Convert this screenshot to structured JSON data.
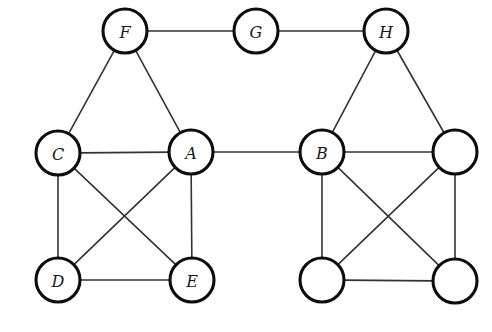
{
  "figure": {
    "width": 492,
    "height": 332,
    "background": "#ffffff",
    "caption": "",
    "node_radius": 22,
    "node_stroke": "#0d0d0d",
    "node_fill": "#ffffff",
    "edge_color": "#333333"
  },
  "graph_data": {
    "type": "node-link-diagram",
    "directed": false,
    "description": "Two complete K4 clusters joined by a single bridge edge A-B, each cluster capped by an apex node (F on the left, H on the right), with F and H linked through an intermediate node G.",
    "node_count": 11,
    "edge_count": 19,
    "nodes": [
      {
        "id": "F",
        "label": "F",
        "x": 125,
        "y": 31,
        "labeled": true
      },
      {
        "id": "G",
        "label": "G",
        "x": 256,
        "y": 31,
        "labeled": true
      },
      {
        "id": "H",
        "label": "H",
        "x": 386,
        "y": 31,
        "labeled": true
      },
      {
        "id": "C",
        "label": "C",
        "x": 58,
        "y": 153,
        "labeled": true
      },
      {
        "id": "A",
        "label": "A",
        "x": 191,
        "y": 152,
        "labeled": true
      },
      {
        "id": "B",
        "label": "B",
        "x": 322,
        "y": 152,
        "labeled": true
      },
      {
        "id": "R1",
        "label": "",
        "x": 455,
        "y": 152,
        "labeled": false
      },
      {
        "id": "D",
        "label": "D",
        "x": 58,
        "y": 280,
        "labeled": true
      },
      {
        "id": "E",
        "label": "E",
        "x": 192,
        "y": 280,
        "labeled": true
      },
      {
        "id": "R2",
        "label": "",
        "x": 322,
        "y": 280,
        "labeled": false
      },
      {
        "id": "R3",
        "label": "",
        "x": 455,
        "y": 281,
        "labeled": false
      }
    ],
    "edges": [
      {
        "source": "F",
        "target": "G"
      },
      {
        "source": "G",
        "target": "H"
      },
      {
        "source": "F",
        "target": "C"
      },
      {
        "source": "F",
        "target": "A"
      },
      {
        "source": "H",
        "target": "B"
      },
      {
        "source": "H",
        "target": "R1"
      },
      {
        "source": "C",
        "target": "A"
      },
      {
        "source": "C",
        "target": "D"
      },
      {
        "source": "C",
        "target": "E"
      },
      {
        "source": "A",
        "target": "D"
      },
      {
        "source": "A",
        "target": "E"
      },
      {
        "source": "D",
        "target": "E"
      },
      {
        "source": "A",
        "target": "B"
      },
      {
        "source": "B",
        "target": "R1"
      },
      {
        "source": "B",
        "target": "R2"
      },
      {
        "source": "B",
        "target": "R3"
      },
      {
        "source": "R1",
        "target": "R2"
      },
      {
        "source": "R1",
        "target": "R3"
      },
      {
        "source": "R2",
        "target": "R3"
      }
    ]
  }
}
